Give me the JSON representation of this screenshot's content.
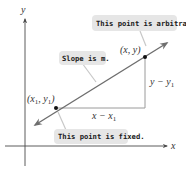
{
  "diagram": {
    "axes": {
      "x_label": "x",
      "y_label": "y"
    },
    "points": {
      "fixed": {
        "label_base_x": "x",
        "label_sub_x": "1",
        "label_base_y": "y",
        "label_sub_y": "1",
        "label_open": "(",
        "label_comma": ", ",
        "label_close": ")"
      },
      "arbitrary": {
        "label": "(x, y)"
      }
    },
    "legs": {
      "horizontal": {
        "base": "x − x",
        "sub": "1"
      },
      "vertical": {
        "base": "y − y",
        "sub": "1"
      }
    },
    "callouts": {
      "arbitrary": "This point is arbitrary.",
      "slope": "Slope is m.",
      "fixed": "This point is fixed."
    },
    "colors": {
      "line": "#6e6e6e",
      "axis": "#4a4a4a",
      "leg": "#9a9a9a",
      "point": "#111111",
      "callout_bg": "#e6e6e6",
      "leader": "#c8c8c8"
    }
  }
}
